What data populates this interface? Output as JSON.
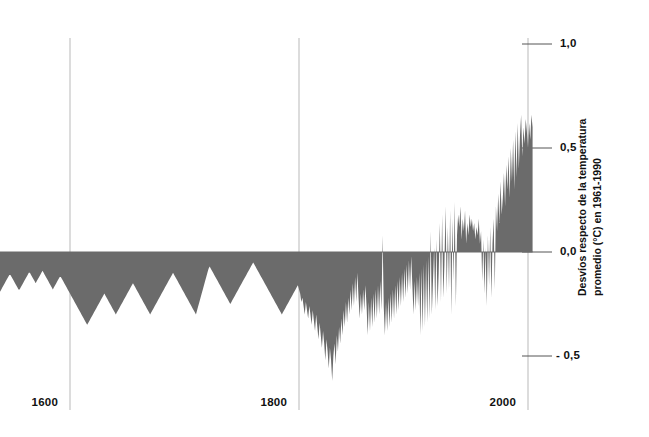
{
  "chart_data": {
    "type": "area",
    "title": "",
    "subtitle": "",
    "xlabel": "",
    "ylabel": "Desvíos respecto de la temperatura promedio (°C) en 1961-1990",
    "ylabel_line1": "Desvíos respecto de la temperatura",
    "ylabel_line2": "promedio (°C) en 1961-1990",
    "xlim": [
      1500,
      2005
    ],
    "ylim": [
      -0.72,
      1.0
    ],
    "baseline": 0.0,
    "grid": "vertical-only",
    "legend": "none",
    "fill_color": "#6b6b6b",
    "axis_color": "#b9b9b9",
    "xticks": [
      1600,
      1800,
      2000
    ],
    "xtick_labels": [
      "1600",
      "1800",
      "2000"
    ],
    "yticks": [
      1.0,
      0.5,
      0.0,
      -0.5
    ],
    "ytick_labels": [
      "1,0",
      "0,5",
      "0,0",
      "- 0,5"
    ],
    "series_name": "Anomalía de temperatura del Hemisferio Norte",
    "x_start": 1500,
    "x_step": 1,
    "values": [
      -0.08,
      -0.06,
      -0.05,
      -0.06,
      -0.08,
      -0.1,
      -0.12,
      -0.14,
      -0.16,
      -0.18,
      -0.2,
      -0.22,
      -0.24,
      -0.25,
      -0.24,
      -0.22,
      -0.2,
      -0.18,
      -0.17,
      -0.16,
      -0.15,
      -0.14,
      -0.13,
      -0.12,
      -0.12,
      -0.13,
      -0.14,
      -0.15,
      -0.16,
      -0.17,
      -0.18,
      -0.19,
      -0.2,
      -0.21,
      -0.22,
      -0.23,
      -0.22,
      -0.21,
      -0.2,
      -0.19,
      -0.18,
      -0.17,
      -0.16,
      -0.15,
      -0.14,
      -0.13,
      -0.12,
      -0.11,
      -0.11,
      -0.12,
      -0.13,
      -0.14,
      -0.15,
      -0.16,
      -0.17,
      -0.18,
      -0.18,
      -0.17,
      -0.16,
      -0.15,
      -0.14,
      -0.13,
      -0.12,
      -0.11,
      -0.1,
      -0.1,
      -0.11,
      -0.12,
      -0.13,
      -0.14,
      -0.15,
      -0.14,
      -0.13,
      -0.12,
      -0.11,
      -0.1,
      -0.09,
      -0.1,
      -0.11,
      -0.12,
      -0.13,
      -0.14,
      -0.15,
      -0.16,
      -0.17,
      -0.18,
      -0.17,
      -0.16,
      -0.15,
      -0.14,
      -0.13,
      -0.12,
      -0.12,
      -0.13,
      -0.14,
      -0.15,
      -0.16,
      -0.17,
      -0.18,
      -0.19,
      -0.2,
      -0.21,
      -0.22,
      -0.23,
      -0.24,
      -0.25,
      -0.26,
      -0.27,
      -0.28,
      -0.29,
      -0.3,
      -0.31,
      -0.32,
      -0.33,
      -0.34,
      -0.35,
      -0.34,
      -0.33,
      -0.32,
      -0.31,
      -0.3,
      -0.29,
      -0.28,
      -0.27,
      -0.26,
      -0.25,
      -0.24,
      -0.23,
      -0.22,
      -0.21,
      -0.2,
      -0.21,
      -0.22,
      -0.23,
      -0.24,
      -0.25,
      -0.26,
      -0.27,
      -0.28,
      -0.29,
      -0.3,
      -0.29,
      -0.28,
      -0.27,
      -0.26,
      -0.25,
      -0.24,
      -0.23,
      -0.22,
      -0.21,
      -0.2,
      -0.19,
      -0.18,
      -0.17,
      -0.16,
      -0.15,
      -0.16,
      -0.17,
      -0.18,
      -0.19,
      -0.2,
      -0.21,
      -0.22,
      -0.23,
      -0.24,
      -0.25,
      -0.26,
      -0.27,
      -0.28,
      -0.29,
      -0.3,
      -0.29,
      -0.28,
      -0.27,
      -0.26,
      -0.25,
      -0.24,
      -0.23,
      -0.22,
      -0.21,
      -0.2,
      -0.19,
      -0.18,
      -0.17,
      -0.16,
      -0.15,
      -0.14,
      -0.13,
      -0.12,
      -0.11,
      -0.1,
      -0.11,
      -0.12,
      -0.13,
      -0.14,
      -0.15,
      -0.16,
      -0.17,
      -0.18,
      -0.19,
      -0.2,
      -0.21,
      -0.22,
      -0.23,
      -0.24,
      -0.25,
      -0.26,
      -0.27,
      -0.28,
      -0.29,
      -0.3,
      -0.28,
      -0.26,
      -0.24,
      -0.22,
      -0.2,
      -0.18,
      -0.16,
      -0.14,
      -0.12,
      -0.1,
      -0.08,
      -0.07,
      -0.08,
      -0.09,
      -0.1,
      -0.11,
      -0.12,
      -0.13,
      -0.14,
      -0.15,
      -0.16,
      -0.17,
      -0.18,
      -0.19,
      -0.2,
      -0.21,
      -0.22,
      -0.23,
      -0.24,
      -0.25,
      -0.24,
      -0.23,
      -0.22,
      -0.21,
      -0.2,
      -0.19,
      -0.18,
      -0.17,
      -0.16,
      -0.15,
      -0.14,
      -0.13,
      -0.12,
      -0.11,
      -0.1,
      -0.09,
      -0.08,
      -0.07,
      -0.06,
      -0.05,
      -0.06,
      -0.07,
      -0.08,
      -0.09,
      -0.1,
      -0.11,
      -0.12,
      -0.13,
      -0.14,
      -0.15,
      -0.16,
      -0.17,
      -0.18,
      -0.19,
      -0.2,
      -0.21,
      -0.22,
      -0.23,
      -0.24,
      -0.25,
      -0.26,
      -0.27,
      -0.28,
      -0.29,
      -0.3,
      -0.29,
      -0.28,
      -0.27,
      -0.26,
      -0.25,
      -0.24,
      -0.23,
      -0.22,
      -0.21,
      -0.2,
      -0.19,
      -0.18,
      -0.17,
      -0.16,
      -0.18,
      -0.2,
      -0.24,
      -0.22,
      -0.26,
      -0.3,
      -0.24,
      -0.28,
      -0.32,
      -0.26,
      -0.3,
      -0.35,
      -0.28,
      -0.33,
      -0.38,
      -0.3,
      -0.36,
      -0.42,
      -0.34,
      -0.4,
      -0.46,
      -0.38,
      -0.44,
      -0.52,
      -0.42,
      -0.48,
      -0.56,
      -0.46,
      -0.52,
      -0.62,
      -0.5,
      -0.44,
      -0.54,
      -0.4,
      -0.48,
      -0.36,
      -0.44,
      -0.32,
      -0.4,
      -0.28,
      -0.36,
      -0.24,
      -0.34,
      -0.22,
      -0.3,
      -0.18,
      -0.28,
      -0.15,
      -0.26,
      -0.12,
      -0.24,
      -0.1,
      -0.22,
      -0.32,
      -0.2,
      -0.3,
      -0.18,
      -0.28,
      -0.16,
      -0.26,
      -0.4,
      -0.24,
      -0.38,
      -0.22,
      -0.36,
      -0.2,
      -0.34,
      -0.18,
      -0.32,
      -0.16,
      -0.3,
      -0.14,
      -0.28,
      0.08,
      -0.26,
      -0.4,
      -0.24,
      -0.38,
      -0.22,
      -0.36,
      -0.2,
      -0.34,
      -0.18,
      -0.32,
      -0.16,
      -0.3,
      -0.14,
      -0.28,
      -0.12,
      -0.26,
      -0.1,
      -0.24,
      -0.08,
      -0.22,
      -0.06,
      -0.2,
      -0.04,
      -0.18,
      -0.02,
      -0.16,
      -0.3,
      -0.14,
      -0.28,
      -0.12,
      -0.26,
      -0.1,
      -0.4,
      -0.08,
      -0.38,
      -0.06,
      -0.36,
      -0.04,
      -0.34,
      -0.02,
      -0.32,
      0.1,
      -0.3,
      -0.14,
      0.02,
      -0.28,
      0.06,
      -0.26,
      -0.1,
      0.14,
      -0.24,
      0.18,
      -0.22,
      -0.06,
      0.22,
      -0.2,
      0.12,
      -0.18,
      0.2,
      -0.3,
      0.16,
      -0.14,
      0.24,
      -0.26,
      0.08,
      0.18,
      0.12,
      0.22,
      0.06,
      0.16,
      0.1,
      0.2,
      0.04,
      0.14,
      0.08,
      0.18,
      0.12,
      0.16,
      0.1,
      0.14,
      0.06,
      0.12,
      0.08,
      0.16,
      0.04,
      0.1,
      -0.14,
      0.06,
      -0.2,
      0.02,
      -0.26,
      0.08,
      -0.16,
      0.12,
      -0.22,
      0.04,
      0.16,
      -0.18,
      0.22,
      0.1,
      0.28,
      0.14,
      0.34,
      0.18,
      0.26,
      0.38,
      0.22,
      0.42,
      0.3,
      0.46,
      0.26,
      0.5,
      0.34,
      0.54,
      0.3,
      0.58,
      0.36,
      0.62,
      0.4,
      0.56,
      0.66,
      0.46,
      0.6,
      0.52,
      0.64,
      0.58,
      0.5,
      0.62,
      0.54,
      0.66,
      0.6
    ]
  }
}
